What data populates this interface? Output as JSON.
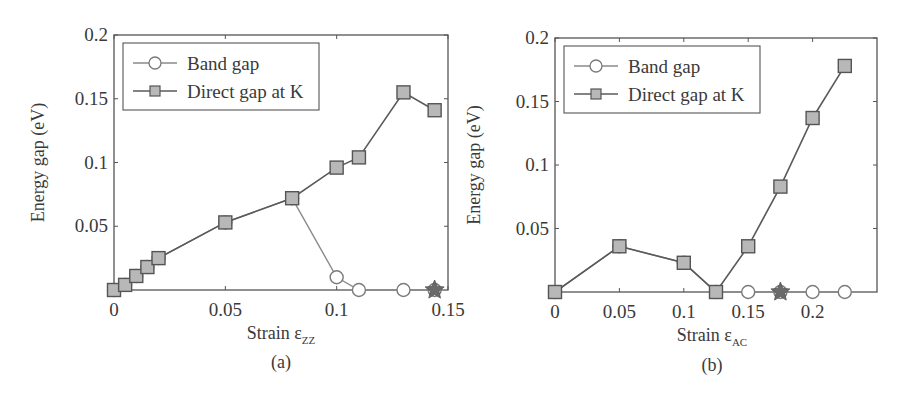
{
  "colors": {
    "axis": "#555555",
    "direct_line": "#5a5a5a",
    "band_line": "#8a8a8a",
    "square_fill": "#b8b8b8",
    "square_stroke": "#555555",
    "circle_fill": "#ffffff",
    "circle_stroke": "#7a7a7a",
    "star_fill": "#6a6a6a"
  },
  "chart_data": [
    {
      "id": "a",
      "type": "line",
      "caption": "(a)",
      "title": "",
      "xlabel": "Strain ε",
      "xlabel_sub": "ZZ",
      "ylabel": "Energy gap (eV)",
      "xlim": [
        0,
        0.15
      ],
      "ylim": [
        0,
        0.2
      ],
      "xticks": [
        0,
        0.05,
        0.1,
        0.15
      ],
      "xtick_labels": [
        "0",
        "0.05",
        "0.1",
        "0.15"
      ],
      "yticks": [
        0.05,
        0.1,
        0.15,
        0.2
      ],
      "ytick_labels": [
        "0.05",
        "0.1",
        "0.15",
        "0.2"
      ],
      "grid": false,
      "legend_position": "upper left",
      "legend": [
        "Band gap",
        "Direct gap at K"
      ],
      "series": [
        {
          "name": "Band gap",
          "marker": "circle",
          "x": [
            0.0,
            0.005,
            0.01,
            0.015,
            0.02,
            0.05,
            0.08,
            0.1,
            0.11,
            0.13,
            0.144
          ],
          "y": [
            0.0,
            0.004,
            0.011,
            0.018,
            0.025,
            0.053,
            0.072,
            0.01,
            0.0,
            0.0,
            0.0
          ]
        },
        {
          "name": "Direct gap at K",
          "marker": "square",
          "x": [
            0.0,
            0.005,
            0.01,
            0.015,
            0.02,
            0.05,
            0.08,
            0.1,
            0.11,
            0.13,
            0.144
          ],
          "y": [
            0.0,
            0.004,
            0.011,
            0.018,
            0.025,
            0.053,
            0.072,
            0.096,
            0.104,
            0.155,
            0.141
          ]
        }
      ],
      "annotations": [
        {
          "type": "star",
          "x": 0.144,
          "y": 0.0
        }
      ]
    },
    {
      "id": "b",
      "type": "line",
      "caption": "(b)",
      "title": "",
      "xlabel": "Strain ε",
      "xlabel_sub": "AC",
      "ylabel": "Energy gap (eV)",
      "xlim": [
        0,
        0.25
      ],
      "ylim": [
        0,
        0.2
      ],
      "xticks": [
        0,
        0.05,
        0.1,
        0.15,
        0.2
      ],
      "xtick_labels": [
        "0",
        "0.05",
        "0.1",
        "0.15",
        "0.2"
      ],
      "yticks": [
        0.05,
        0.1,
        0.15,
        0.2
      ],
      "ytick_labels": [
        "0.05",
        "0.1",
        "0.15",
        "0.2"
      ],
      "grid": false,
      "legend_position": "upper left",
      "legend": [
        "Band gap",
        "Direct gap at K"
      ],
      "series": [
        {
          "name": "Band gap",
          "marker": "circle",
          "x": [
            0.0,
            0.05,
            0.1,
            0.125,
            0.15,
            0.175,
            0.2,
            0.225
          ],
          "y": [
            0.0,
            0.036,
            0.023,
            0.0,
            0.0,
            0.0,
            0.0,
            0.0
          ]
        },
        {
          "name": "Direct gap at K",
          "marker": "square",
          "x": [
            0.0,
            0.05,
            0.1,
            0.125,
            0.15,
            0.175,
            0.2,
            0.225
          ],
          "y": [
            0.0,
            0.036,
            0.023,
            0.0,
            0.036,
            0.083,
            0.137,
            0.178
          ]
        }
      ],
      "annotations": [
        {
          "type": "star",
          "x": 0.175,
          "y": 0.0
        }
      ]
    }
  ],
  "layout": {
    "panels": [
      {
        "left": 114,
        "top": 35,
        "right": 448,
        "bottom": 290,
        "ylabel_x": 44,
        "xlabel_x": 281,
        "xlabel_y": 339,
        "caption_y": 368
      },
      {
        "left": 555,
        "top": 38,
        "right": 877,
        "bottom": 292,
        "ylabel_x": 480,
        "xlabel_x": 712,
        "xlabel_y": 341,
        "caption_y": 371
      }
    ]
  }
}
